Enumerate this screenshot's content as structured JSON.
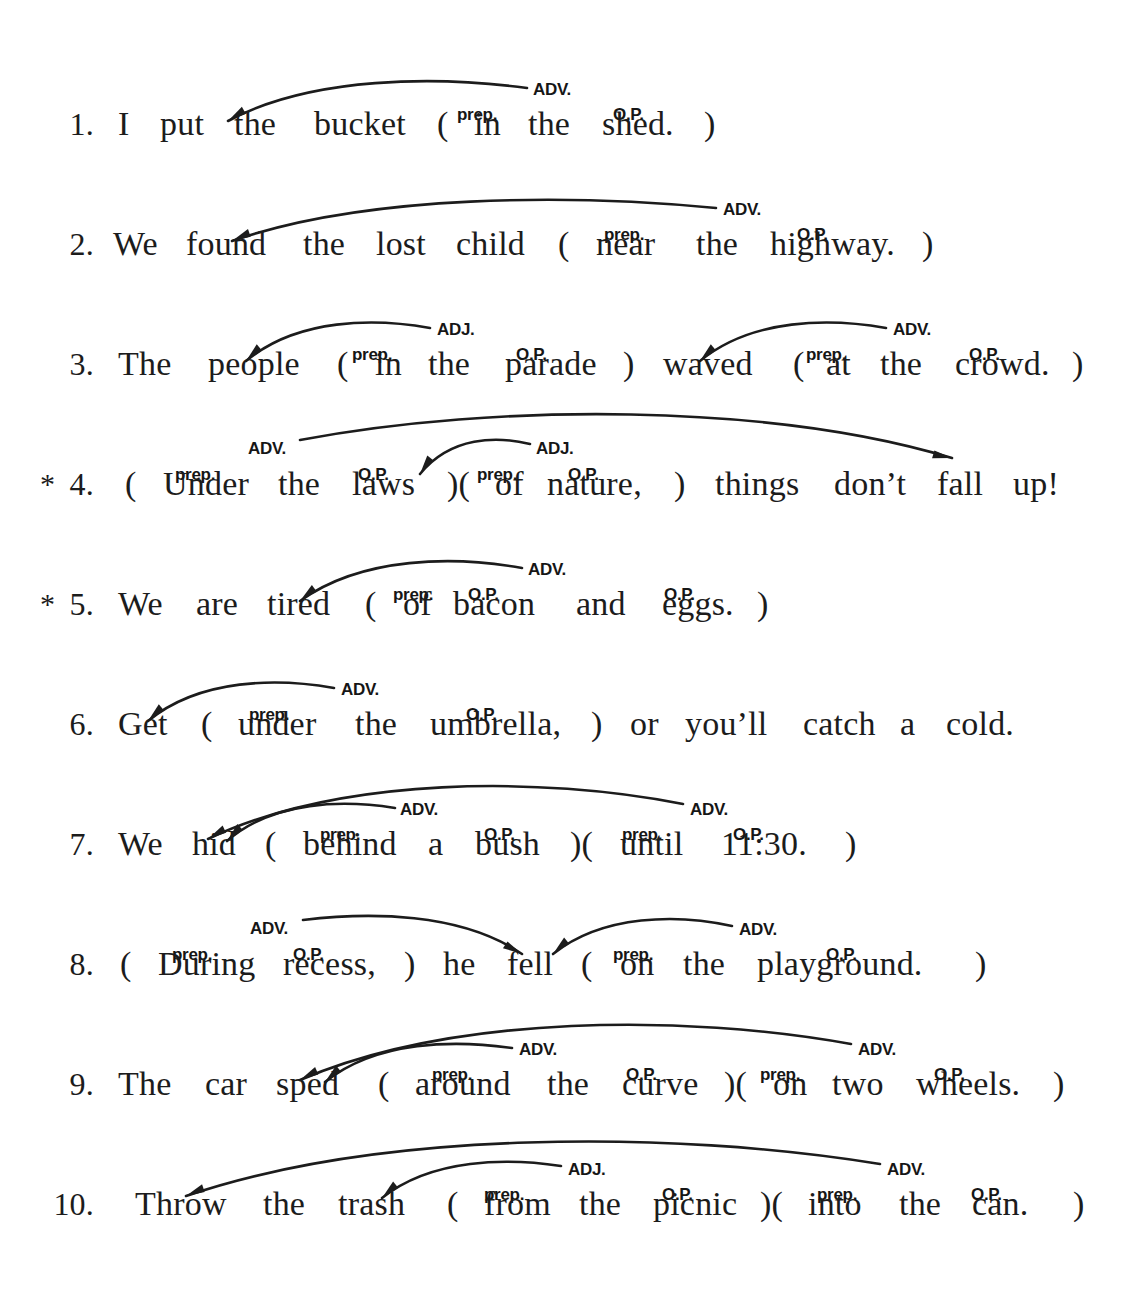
{
  "document": {
    "type": "grammar-worksheet",
    "topic": "prepositional-phrases",
    "ink_color": "#1c1c1c",
    "page_background": "#ffffff"
  },
  "labels": {
    "prep": "prep.",
    "op": "O.P.",
    "adv": "ADV.",
    "adj": "ADJ."
  },
  "items": [
    {
      "number": "1.",
      "star": "",
      "sentence": "I  put  the  bucket  (  in  the  shed.  )",
      "words": [
        {
          "t": "I",
          "x": 118
        },
        {
          "t": "put",
          "x": 160
        },
        {
          "t": "the",
          "x": 234
        },
        {
          "t": "bucket",
          "x": 314
        },
        {
          "t": "(",
          "x": 437
        },
        {
          "t": "in",
          "x": 474
        },
        {
          "t": "the",
          "x": 528
        },
        {
          "t": "shed.",
          "x": 602
        },
        {
          "t": ")",
          "x": 704
        }
      ],
      "tags": [
        {
          "text": "prep.",
          "x": 457,
          "y": 78
        },
        {
          "text": "O.P.",
          "x": 613,
          "y": 78
        },
        {
          "text": "ADV.",
          "x": 533,
          "y": 53
        }
      ],
      "arcs": [
        {
          "label": "ADV.",
          "from_x": 527,
          "to_x": 228,
          "top_y": 48,
          "start_y": 60,
          "end_y": 93,
          "dir": "left"
        }
      ]
    },
    {
      "number": "2.",
      "star": "",
      "sentence": "We  found  the  lost  child  (  near  the  highway.  )",
      "words": [
        {
          "t": "We",
          "x": 113
        },
        {
          "t": "found",
          "x": 186
        },
        {
          "t": "the",
          "x": 303
        },
        {
          "t": "lost",
          "x": 376
        },
        {
          "t": "child",
          "x": 456
        },
        {
          "t": "(",
          "x": 558
        },
        {
          "t": "near",
          "x": 596
        },
        {
          "t": "the",
          "x": 696
        },
        {
          "t": "highway.",
          "x": 770
        },
        {
          "t": ")",
          "x": 922
        }
      ],
      "tags": [
        {
          "text": "prep.",
          "x": 604,
          "y": 78
        },
        {
          "text": "O.P.",
          "x": 797,
          "y": 78
        },
        {
          "text": "ADV.",
          "x": 723,
          "y": 53
        }
      ],
      "arcs": [
        {
          "label": "ADV.",
          "from_x": 716,
          "to_x": 232,
          "top_y": 46,
          "start_y": 60,
          "end_y": 93,
          "dir": "left"
        }
      ]
    },
    {
      "number": "3.",
      "star": "",
      "sentence": "The  people  (  in  the  parade  )  waved  (  at  the  crowd.  )",
      "words": [
        {
          "t": "The",
          "x": 118
        },
        {
          "t": "people",
          "x": 208
        },
        {
          "t": "(",
          "x": 337
        },
        {
          "t": "in",
          "x": 375
        },
        {
          "t": "the",
          "x": 428
        },
        {
          "t": "parade",
          "x": 505
        },
        {
          "t": ")",
          "x": 623
        },
        {
          "t": "waved",
          "x": 663
        },
        {
          "t": "(",
          "x": 793
        },
        {
          "t": "at",
          "x": 826
        },
        {
          "t": "the",
          "x": 880
        },
        {
          "t": "crowd.",
          "x": 955
        },
        {
          "t": ")",
          "x": 1072
        }
      ],
      "tags": [
        {
          "text": "prep.",
          "x": 352,
          "y": 78
        },
        {
          "text": "O.P.",
          "x": 516,
          "y": 78
        },
        {
          "text": "ADJ.",
          "x": 437,
          "y": 53
        },
        {
          "text": "prep.",
          "x": 806,
          "y": 78
        },
        {
          "text": "O.P.",
          "x": 969,
          "y": 78
        },
        {
          "text": "ADV.",
          "x": 893,
          "y": 53
        }
      ],
      "arcs": [
        {
          "label": "ADJ.",
          "from_x": 430,
          "to_x": 246,
          "top_y": 50,
          "start_y": 60,
          "end_y": 93,
          "dir": "left"
        },
        {
          "label": "ADV.",
          "from_x": 886,
          "to_x": 700,
          "top_y": 50,
          "start_y": 60,
          "end_y": 93,
          "dir": "left"
        }
      ]
    },
    {
      "number": "4.",
      "star": "*",
      "sentence": "(  Under  the  laws  )(  of  nature,  )  things  don't  fall  up!",
      "words": [
        {
          "t": "(",
          "x": 125
        },
        {
          "t": "Under",
          "x": 163
        },
        {
          "t": "the",
          "x": 278
        },
        {
          "t": "laws",
          "x": 352
        },
        {
          "t": ")(",
          "x": 447
        },
        {
          "t": "of",
          "x": 495
        },
        {
          "t": "nature,",
          "x": 547
        },
        {
          "t": ")",
          "x": 674
        },
        {
          "t": "things",
          "x": 715
        },
        {
          "t": "don’t",
          "x": 834
        },
        {
          "t": "fall",
          "x": 937
        },
        {
          "t": "up!",
          "x": 1013
        }
      ],
      "tags": [
        {
          "text": "prep.",
          "x": 175,
          "y": 78
        },
        {
          "text": "O.P.",
          "x": 358,
          "y": 78
        },
        {
          "text": "ADV.",
          "x": 248,
          "y": 52
        },
        {
          "text": "prep.",
          "x": 477,
          "y": 78
        },
        {
          "text": "O.P.",
          "x": 568,
          "y": 78
        },
        {
          "text": "ADJ.",
          "x": 536,
          "y": 52
        }
      ],
      "arcs": [
        {
          "label": "ADV.",
          "from_x": 300,
          "to_x": 952,
          "top_y": 15,
          "start_y": 52,
          "end_y": 70,
          "dir": "right"
        },
        {
          "label": "ADJ.",
          "from_x": 530,
          "to_x": 420,
          "top_y": 48,
          "start_y": 56,
          "end_y": 86,
          "dir": "left"
        }
      ]
    },
    {
      "number": "5.",
      "star": "*",
      "sentence": "We  are  tired  (  of  bacon  and  eggs.  )",
      "words": [
        {
          "t": "We",
          "x": 118
        },
        {
          "t": "are",
          "x": 196
        },
        {
          "t": "tired",
          "x": 267
        },
        {
          "t": "(",
          "x": 365
        },
        {
          "t": "of",
          "x": 403
        },
        {
          "t": "bacon",
          "x": 453
        },
        {
          "t": "and",
          "x": 576
        },
        {
          "t": "eggs.",
          "x": 662
        },
        {
          "t": ")",
          "x": 757
        }
      ],
      "tags": [
        {
          "text": "prep.",
          "x": 393,
          "y": 78
        },
        {
          "text": "O.P.",
          "x": 468,
          "y": 78
        },
        {
          "text": "O.P.",
          "x": 664,
          "y": 78
        },
        {
          "text": "ADV.",
          "x": 528,
          "y": 53
        }
      ],
      "arcs": [
        {
          "label": "ADV.",
          "from_x": 522,
          "to_x": 300,
          "top_y": 48,
          "start_y": 60,
          "end_y": 93,
          "dir": "left"
        }
      ]
    },
    {
      "number": "6.",
      "star": "",
      "sentence": "Get  (  under  the  umbrella,  )  or  you'll  catch  a  cold.",
      "words": [
        {
          "t": "Get",
          "x": 118
        },
        {
          "t": "(",
          "x": 201
        },
        {
          "t": "under",
          "x": 238
        },
        {
          "t": "the",
          "x": 355
        },
        {
          "t": "umbrella,",
          "x": 430
        },
        {
          "t": ")",
          "x": 591
        },
        {
          "t": "or",
          "x": 630
        },
        {
          "t": "you’ll",
          "x": 685
        },
        {
          "t": "catch",
          "x": 803
        },
        {
          "t": "a",
          "x": 900
        },
        {
          "t": "cold.",
          "x": 946
        }
      ],
      "tags": [
        {
          "text": "prep.",
          "x": 249,
          "y": 78
        },
        {
          "text": "O.P.",
          "x": 466,
          "y": 78
        },
        {
          "text": "ADV.",
          "x": 341,
          "y": 53
        }
      ],
      "arcs": [
        {
          "label": "ADV.",
          "from_x": 334,
          "to_x": 148,
          "top_y": 50,
          "start_y": 60,
          "end_y": 93,
          "dir": "left"
        }
      ]
    },
    {
      "number": "7.",
      "star": "",
      "sentence": "We  hid  (  behind  a  bush  )(  until  11:30.  )",
      "words": [
        {
          "t": "We",
          "x": 118
        },
        {
          "t": "hid",
          "x": 192
        },
        {
          "t": "(",
          "x": 265
        },
        {
          "t": "behind",
          "x": 303
        },
        {
          "t": "a",
          "x": 428
        },
        {
          "t": "bush",
          "x": 475
        },
        {
          "t": ")(",
          "x": 570
        },
        {
          "t": "until",
          "x": 620
        },
        {
          "t": "11:30.",
          "x": 721
        },
        {
          "t": ")",
          "x": 845
        }
      ],
      "tags": [
        {
          "text": "prep.",
          "x": 320,
          "y": 78
        },
        {
          "text": "O.P.",
          "x": 484,
          "y": 78
        },
        {
          "text": "ADV.",
          "x": 400,
          "y": 53
        },
        {
          "text": "prep.",
          "x": 622,
          "y": 78
        },
        {
          "text": "O.P.",
          "x": 733,
          "y": 78
        },
        {
          "text": "ADV.",
          "x": 690,
          "y": 53
        }
      ],
      "arcs": [
        {
          "label": "ADV.",
          "from_x": 683,
          "to_x": 208,
          "top_y": 28,
          "start_y": 56,
          "end_y": 91,
          "dir": "left"
        },
        {
          "label": "ADV.",
          "from_x": 395,
          "to_x": 227,
          "top_y": 52,
          "start_y": 60,
          "end_y": 93,
          "dir": "left"
        }
      ]
    },
    {
      "number": "8.",
      "star": "",
      "sentence": "(  During  recess,  )  he  fell  (  on  the  playground.  )",
      "words": [
        {
          "t": "(",
          "x": 120
        },
        {
          "t": "During",
          "x": 158
        },
        {
          "t": "recess,",
          "x": 283
        },
        {
          "t": ")",
          "x": 404
        },
        {
          "t": "he",
          "x": 443
        },
        {
          "t": "fell",
          "x": 507
        },
        {
          "t": "(",
          "x": 581
        },
        {
          "t": "on",
          "x": 620
        },
        {
          "t": "the",
          "x": 683
        },
        {
          "t": "playground.",
          "x": 757
        },
        {
          "t": ")",
          "x": 975
        }
      ],
      "tags": [
        {
          "text": "prep.",
          "x": 172,
          "y": 78
        },
        {
          "text": "O.P.",
          "x": 293,
          "y": 78
        },
        {
          "text": "ADV.",
          "x": 250,
          "y": 52
        },
        {
          "text": "prep.",
          "x": 613,
          "y": 78
        },
        {
          "text": "O.P.",
          "x": 826,
          "y": 78
        },
        {
          "text": "ADV.",
          "x": 739,
          "y": 53
        }
      ],
      "arcs": [
        {
          "label": "ADV.",
          "from_x": 303,
          "to_x": 522,
          "top_y": 44,
          "start_y": 52,
          "end_y": 86,
          "dir": "right"
        },
        {
          "label": "ADV.",
          "from_x": 732,
          "to_x": 553,
          "top_y": 46,
          "start_y": 58,
          "end_y": 86,
          "dir": "left"
        }
      ]
    },
    {
      "number": "9.",
      "star": "",
      "sentence": "The  car  sped  (  around  the  curve  )(  on  two  wheels.  )",
      "words": [
        {
          "t": "The",
          "x": 118
        },
        {
          "t": "car",
          "x": 205
        },
        {
          "t": "sped",
          "x": 276
        },
        {
          "t": "(",
          "x": 378
        },
        {
          "t": "around",
          "x": 415
        },
        {
          "t": "the",
          "x": 547
        },
        {
          "t": "curve",
          "x": 622
        },
        {
          "t": ")(",
          "x": 724
        },
        {
          "t": "on",
          "x": 773
        },
        {
          "t": "two",
          "x": 832
        },
        {
          "t": "wheels.",
          "x": 916
        },
        {
          "t": ")",
          "x": 1053
        }
      ],
      "tags": [
        {
          "text": "prep.",
          "x": 432,
          "y": 78
        },
        {
          "text": "O.P.",
          "x": 626,
          "y": 78
        },
        {
          "text": "ADV.",
          "x": 519,
          "y": 53
        },
        {
          "text": "prep.",
          "x": 760,
          "y": 78
        },
        {
          "text": "O.P.",
          "x": 934,
          "y": 78
        },
        {
          "text": "ADV.",
          "x": 858,
          "y": 53
        }
      ],
      "arcs": [
        {
          "label": "ADV.",
          "from_x": 851,
          "to_x": 300,
          "top_y": 26,
          "start_y": 56,
          "end_y": 92,
          "dir": "left"
        },
        {
          "label": "ADV.",
          "from_x": 512,
          "to_x": 325,
          "top_y": 52,
          "start_y": 60,
          "end_y": 94,
          "dir": "left"
        }
      ]
    },
    {
      "number": "10.",
      "star": "",
      "sentence": "Throw  the  trash  (  from  the  picnic  )(  into  the  can.  )",
      "words": [
        {
          "t": "Throw",
          "x": 135
        },
        {
          "t": "the",
          "x": 263
        },
        {
          "t": "trash",
          "x": 338
        },
        {
          "t": "(",
          "x": 447
        },
        {
          "t": "from",
          "x": 484
        },
        {
          "t": "the",
          "x": 579
        },
        {
          "t": "picnic",
          "x": 653
        },
        {
          "t": ")(",
          "x": 760
        },
        {
          "t": "into",
          "x": 808
        },
        {
          "t": "the",
          "x": 899
        },
        {
          "t": "can.",
          "x": 972
        },
        {
          "t": ")",
          "x": 1073
        }
      ],
      "tags": [
        {
          "text": "prep.",
          "x": 484,
          "y": 78
        },
        {
          "text": "O.P.",
          "x": 662,
          "y": 78
        },
        {
          "text": "ADJ.",
          "x": 568,
          "y": 53
        },
        {
          "text": "prep.",
          "x": 817,
          "y": 78
        },
        {
          "text": "O.P.",
          "x": 971,
          "y": 78
        },
        {
          "text": "ADV.",
          "x": 887,
          "y": 53
        }
      ],
      "arcs": [
        {
          "label": "ADV.",
          "from_x": 880,
          "to_x": 186,
          "top_y": 22,
          "start_y": 56,
          "end_y": 88,
          "dir": "left"
        },
        {
          "label": "ADJ.",
          "from_x": 561,
          "to_x": 382,
          "top_y": 50,
          "start_y": 58,
          "end_y": 90,
          "dir": "left"
        }
      ]
    }
  ]
}
